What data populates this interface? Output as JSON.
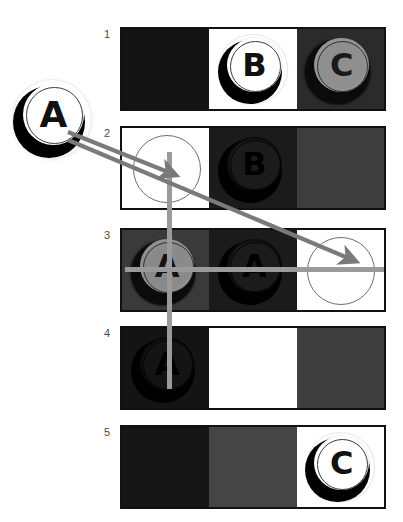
{
  "canvas": {
    "width": 403,
    "height": 522,
    "background": "#ffffff"
  },
  "palette": {
    "near_black": "#141414",
    "dark_gray": "#2b2b2b",
    "mid_dark_gray": "#3a3a3a",
    "mid_gray": "#454545",
    "light_gray_token": "#8f8f8f",
    "white": "#ffffff",
    "border": "#111111",
    "guide_line": "#9a9a9a",
    "arrow": "#7a7a7a",
    "number_text": "#4a4a4a"
  },
  "rows": [
    {
      "number": "1",
      "cells": [
        {
          "bg": "#141414",
          "token": null,
          "slot_circle": false
        },
        {
          "bg": "#ffffff",
          "token": {
            "letter": "B",
            "face": "#ffffff",
            "glyph_color": "#111111",
            "style": "light-on-white"
          },
          "slot_circle": false
        },
        {
          "bg": "#2b2b2b",
          "token": {
            "letter": "C",
            "face": "#8f8f8f",
            "glyph_color": "#1a1a1a",
            "style": "gray-on-dark"
          },
          "slot_circle": false
        }
      ]
    },
    {
      "number": "2",
      "cells": [
        {
          "bg": "#ffffff",
          "token": null,
          "slot_circle": true
        },
        {
          "bg": "#1b1b1b",
          "token": {
            "letter": "B",
            "face": "#1b1b1b",
            "glyph_color": "#000000",
            "style": "dark-on-dark"
          },
          "slot_circle": false
        },
        {
          "bg": "#3e3e3e",
          "token": null,
          "slot_circle": false
        }
      ]
    },
    {
      "number": "3",
      "cells": [
        {
          "bg": "#3a3a3a",
          "token": {
            "letter": "A",
            "face": "#8a8a8a",
            "glyph_color": "#141414",
            "style": "gray-on-dark"
          },
          "slot_circle": false
        },
        {
          "bg": "#1b1b1b",
          "token": {
            "letter": "A",
            "face": "#1b1b1b",
            "glyph_color": "#000000",
            "style": "dark-on-dark"
          },
          "slot_circle": false
        },
        {
          "bg": "#ffffff",
          "token": null,
          "slot_circle": true
        }
      ]
    },
    {
      "number": "4",
      "cells": [
        {
          "bg": "#141414",
          "token": {
            "letter": "A",
            "face": "#141414",
            "glyph_color": "#000000",
            "style": "dark-on-dark"
          },
          "slot_circle": false
        },
        {
          "bg": "#ffffff",
          "token": null,
          "slot_circle": false
        },
        {
          "bg": "#3e3e3e",
          "token": null,
          "slot_circle": false
        }
      ]
    },
    {
      "number": "5",
      "cells": [
        {
          "bg": "#161616",
          "token": null,
          "slot_circle": false
        },
        {
          "bg": "#454545",
          "token": null,
          "slot_circle": false
        },
        {
          "bg": "#ffffff",
          "token": {
            "letter": "C",
            "face": "#ffffff",
            "glyph_color": "#111111",
            "style": "light-on-white"
          },
          "slot_circle": false
        }
      ]
    }
  ],
  "source_token": {
    "letter": "A",
    "face": "#ffffff",
    "glyph_color": "#111111",
    "style": "light-on-white"
  },
  "annotations": {
    "arrow_1": {
      "label": "arrow-a-to-row2-left-slot",
      "from": [
        68,
        132
      ],
      "to": [
        168,
        172
      ]
    },
    "arrow_2": {
      "label": "arrow-a-to-row3-right-slot",
      "from": [
        68,
        140
      ],
      "to": [
        348,
        258
      ]
    },
    "guide_vertical": {
      "label": "vertical-guide-line",
      "x": 167,
      "y1": 152,
      "y2": 389
    },
    "guide_horizontal": {
      "label": "horizontal-guide-line",
      "y": 267,
      "x1": 125,
      "x2": 384
    }
  }
}
